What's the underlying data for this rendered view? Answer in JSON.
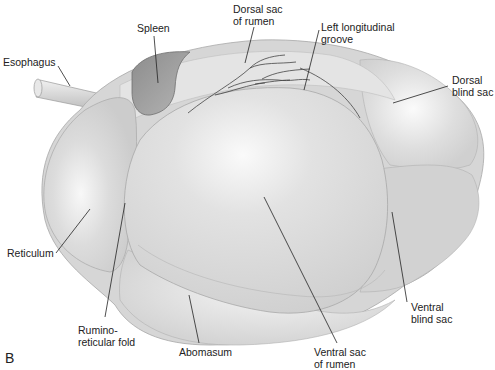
{
  "figure": {
    "panel_letter": "B",
    "colors": {
      "background": "#ffffff",
      "organ_fill": "#d6d6d6",
      "organ_light": "#f4f4f4",
      "organ_outline": "#a8a8a8",
      "spleen_fill": "#9d9d9d",
      "leader_line": "#222222",
      "vessel": "#444444"
    },
    "labels": [
      {
        "id": "esophagus",
        "text": "Esophagus",
        "x": 3,
        "y": 56
      },
      {
        "id": "spleen",
        "text": "Spleen",
        "x": 137,
        "y": 22
      },
      {
        "id": "dorsal-sac-rumen",
        "text": "Dorsal sac\nof rumen",
        "x": 233,
        "y": 3
      },
      {
        "id": "left-longitudinal-groove",
        "text": "Left longitudinal\ngroove",
        "x": 321,
        "y": 21
      },
      {
        "id": "dorsal-blind-sac",
        "text": "Dorsal\nblind sac",
        "x": 452,
        "y": 74
      },
      {
        "id": "reticulum",
        "text": "Reticulum",
        "x": 7,
        "y": 247
      },
      {
        "id": "rumino-reticular-fold",
        "text": "Rumino-\nreticular fold",
        "x": 78,
        "y": 324
      },
      {
        "id": "abomasum",
        "text": "Abomasum",
        "x": 179,
        "y": 346
      },
      {
        "id": "ventral-sac-rumen",
        "text": "Ventral sac\nof rumen",
        "x": 314,
        "y": 346
      },
      {
        "id": "ventral-blind-sac",
        "text": "Ventral\nblind sac",
        "x": 411,
        "y": 301
      }
    ]
  }
}
